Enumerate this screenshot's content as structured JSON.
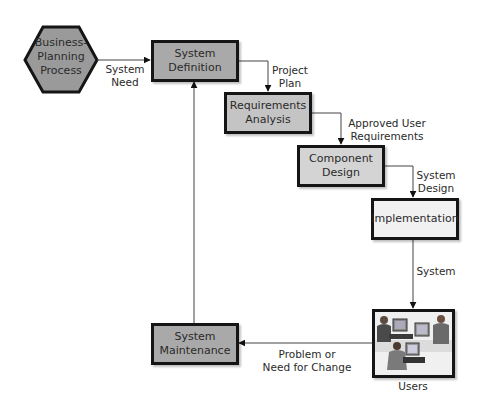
{
  "diagram": {
    "type": "flowchart",
    "nodes": {
      "business_planning": {
        "line1": "Business-",
        "line2": "Planning",
        "line3": "Process",
        "shape": "hexagon"
      },
      "system_definition": {
        "line1": "System",
        "line2": "Definition"
      },
      "requirements_analysis": {
        "line1": "Requirements",
        "line2": "Analysis"
      },
      "component_design": {
        "line1": "Component",
        "line2": "Design"
      },
      "implementation": {
        "line1": "Implementation"
      },
      "users": {
        "label": "Users",
        "image": "people-at-computers-illustration"
      },
      "system_maintenance": {
        "line1": "System",
        "line2": "Maintenance"
      }
    },
    "edges": {
      "system_need": {
        "line1": "System",
        "line2": "Need",
        "from": "Business-Planning Process",
        "to": "System Definition"
      },
      "project_plan": {
        "line1": "Project",
        "line2": "Plan",
        "from": "System Definition",
        "to": "Requirements Analysis"
      },
      "approved_user_requirements": {
        "line1": "Approved User",
        "line2": "Requirements",
        "from": "Requirements Analysis",
        "to": "Component Design"
      },
      "system_design": {
        "line1": "System",
        "line2": "Design",
        "from": "Component Design",
        "to": "Implementation"
      },
      "system": {
        "line1": "System",
        "from": "Implementation",
        "to": "Users"
      },
      "problem_or_need": {
        "line1": "Problem or",
        "line2": "Need for Change",
        "from": "Users",
        "to": "System Maintenance"
      },
      "maintenance_loop": {
        "from": "System Maintenance",
        "to": "System Definition"
      }
    },
    "colors": {
      "border": "#151515",
      "hexagon_fill": "#9a9a9a",
      "dark_box_fill": "#a9a9a9",
      "mid_box_fill": "#c4c4c4",
      "light_box_fill": "#d4d4d4",
      "white_box_fill": "#f1f1f1",
      "line": "#333333"
    }
  }
}
